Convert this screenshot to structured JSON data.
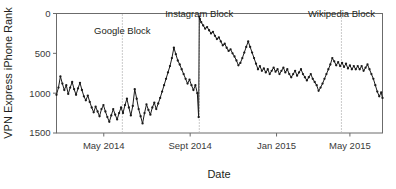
{
  "chart_data": {
    "type": "line",
    "title": "",
    "xlabel": "Date",
    "ylabel": "VPN Express iPhone Rank",
    "y_inverted": true,
    "ylim": [
      0,
      1500
    ],
    "ytick_values": [
      0,
      500,
      1000,
      1500
    ],
    "ytick_labels": [
      "0",
      "500",
      "1000",
      "1500"
    ],
    "xlim": [
      0,
      100
    ],
    "xtick_positions": [
      14.5,
      41.0,
      67.5,
      90.0
    ],
    "xtick_labels": [
      "May 2014",
      "Sept 2014",
      "Jan 2015",
      "May 2015"
    ],
    "grid": false,
    "legend": null,
    "marker": "filled-circle",
    "line_color": "#1a1a1a",
    "annotations": [
      {
        "label": "Google Block",
        "x": 20.2,
        "label_x": 20.2,
        "label_y": 260,
        "line_style": "dotted"
      },
      {
        "label": "Instagram Block",
        "x": 43.8,
        "label_x": 43.8,
        "label_y": 40,
        "line_style": "dotted"
      },
      {
        "label": "Wikipedia Block",
        "x": 87.4,
        "label_x": 87.4,
        "label_y": 40,
        "line_style": "dotted"
      }
    ],
    "x": [
      0.0,
      0.6,
      1.2,
      1.8,
      2.4,
      3.0,
      3.6,
      4.2,
      4.8,
      5.4,
      6.0,
      6.6,
      7.2,
      7.8,
      8.4,
      9.0,
      9.6,
      10.2,
      10.8,
      11.4,
      12.0,
      12.6,
      13.2,
      13.8,
      14.4,
      15.0,
      15.6,
      16.2,
      16.8,
      17.4,
      18.0,
      18.6,
      19.2,
      19.8,
      20.4,
      21.0,
      21.6,
      22.2,
      22.8,
      23.4,
      24.0,
      24.6,
      25.2,
      25.8,
      26.4,
      27.0,
      27.6,
      28.2,
      28.8,
      29.4,
      30.0,
      30.6,
      31.2,
      31.8,
      32.4,
      33.0,
      33.6,
      34.2,
      34.8,
      35.4,
      36.0,
      36.6,
      37.2,
      37.8,
      38.4,
      39.0,
      39.6,
      40.2,
      40.8,
      41.4,
      42.0,
      42.6,
      43.2,
      43.6,
      43.8,
      44.0,
      44.4,
      45.0,
      45.6,
      46.2,
      46.8,
      47.4,
      48.0,
      48.6,
      49.2,
      49.8,
      50.4,
      51.0,
      51.6,
      52.2,
      52.8,
      53.4,
      54.0,
      54.6,
      55.2,
      55.8,
      56.4,
      57.0,
      57.6,
      58.2,
      58.8,
      59.4,
      60.0,
      60.6,
      61.2,
      61.8,
      62.4,
      63.0,
      63.6,
      64.2,
      64.8,
      65.4,
      66.0,
      66.6,
      67.2,
      67.8,
      68.4,
      69.0,
      69.6,
      70.2,
      70.8,
      71.4,
      72.0,
      72.6,
      73.2,
      73.8,
      74.4,
      75.0,
      75.6,
      76.2,
      76.8,
      77.4,
      78.0,
      78.6,
      79.2,
      79.8,
      80.4,
      81.0,
      81.6,
      82.2,
      82.8,
      83.4,
      84.0,
      84.6,
      85.2,
      85.8,
      86.4,
      87.0,
      87.6,
      88.2,
      88.8,
      89.4,
      90.0,
      90.6,
      91.2,
      91.8,
      92.4,
      93.0,
      93.6,
      94.2,
      94.8,
      95.4,
      96.0,
      96.6,
      97.2,
      97.8,
      98.4,
      99.0,
      99.6,
      100.0
    ],
    "y": [
      1020,
      930,
      790,
      880,
      960,
      900,
      1010,
      930,
      860,
      950,
      1020,
      940,
      870,
      960,
      1040,
      1090,
      1030,
      1110,
      1180,
      1240,
      1170,
      1230,
      1290,
      1200,
      1150,
      1230,
      1300,
      1360,
      1280,
      1200,
      1270,
      1330,
      1250,
      1180,
      1250,
      1150,
      1070,
      1180,
      1280,
      1160,
      950,
      1070,
      1200,
      1290,
      1380,
      1250,
      1140,
      1210,
      1270,
      1180,
      1120,
      1200,
      1130,
      1060,
      980,
      900,
      820,
      740,
      660,
      560,
      430,
      510,
      590,
      640,
      700,
      760,
      820,
      880,
      830,
      900,
      960,
      900,
      1000,
      1300,
      40,
      70,
      110,
      150,
      190,
      170,
      210,
      250,
      230,
      280,
      320,
      300,
      350,
      400,
      380,
      430,
      470,
      450,
      500,
      540,
      590,
      650,
      620,
      560,
      490,
      420,
      350,
      420,
      490,
      560,
      630,
      700,
      660,
      720,
      690,
      740,
      700,
      760,
      720,
      680,
      730,
      700,
      760,
      720,
      680,
      740,
      700,
      760,
      800,
      760,
      720,
      780,
      740,
      700,
      760,
      800,
      840,
      800,
      760,
      820,
      860,
      900,
      970,
      930,
      880,
      820,
      760,
      700,
      640,
      560,
      600,
      650,
      610,
      660,
      620,
      670,
      630,
      690,
      650,
      700,
      660,
      700,
      660,
      700,
      660,
      720,
      680,
      640,
      700,
      760,
      820,
      900,
      980,
      1040,
      990,
      1060,
      1010,
      940,
      880,
      700
    ]
  },
  "accent_colors": {
    "series": "#1a1a1a",
    "frame": "#6b6b6b",
    "annotation_line": "#8a8a8a",
    "background": "#ffffff"
  }
}
